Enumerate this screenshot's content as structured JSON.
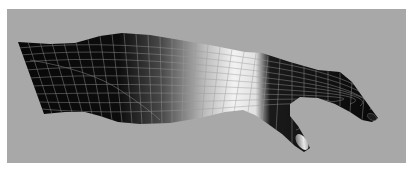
{
  "image": {
    "subject": "3D wireframe render of a forearm and hand",
    "background_color": "#a8a8a8",
    "mesh_dark_color": "#0a0a0a",
    "mesh_highlight_color": "#f4f4f4",
    "wire_color": "#9a9a9a",
    "nail_color": "#d8d8d8"
  }
}
